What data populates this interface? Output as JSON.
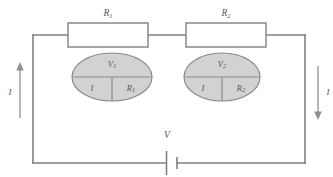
{
  "figure": {
    "type": "series-circuit-schematic",
    "background_color": "#ffffff",
    "wire_color": "#808080",
    "meter_fill_color": "#d2d2d2",
    "label_color": "#555555"
  },
  "resistors": [
    {
      "id": "r1",
      "label": "R",
      "subscript": "1",
      "box_fill": "#ffffff"
    },
    {
      "id": "r2",
      "label": "R",
      "subscript": "2",
      "box_fill": "#ffffff"
    }
  ],
  "meters": [
    {
      "id": "meter1",
      "top_label": "V",
      "top_subscript": "1",
      "bottom_left_label": "I",
      "bottom_right_label": "R",
      "bottom_right_subscript": "1"
    },
    {
      "id": "meter2",
      "top_label": "V",
      "top_subscript": "2",
      "bottom_left_label": "I",
      "bottom_right_label": "R",
      "bottom_right_subscript": "2"
    }
  ],
  "source": {
    "id": "battery",
    "label": "V",
    "symbol": "battery-cell"
  },
  "current_arrows": [
    {
      "id": "current-left",
      "label": "I",
      "direction": "up",
      "side": "left"
    },
    {
      "id": "current-right",
      "label": "I",
      "direction": "down",
      "side": "right"
    }
  ]
}
